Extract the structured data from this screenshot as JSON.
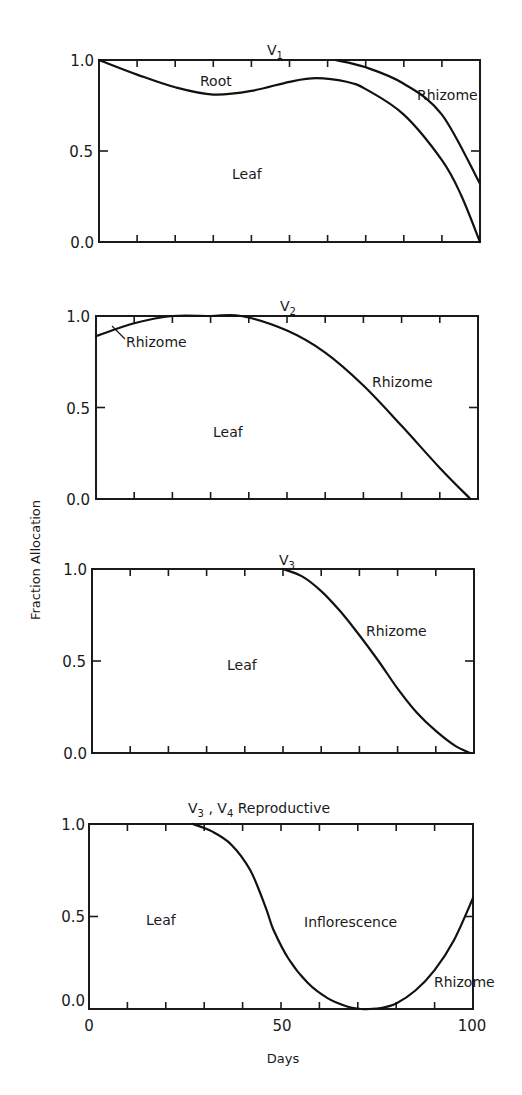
{
  "figure": {
    "ylabel": "Fraction  Allocation",
    "xlabel": "Days",
    "x_tick_labels": [
      "0",
      "50",
      "100"
    ],
    "y_tick_labels": [
      "1.0",
      "0.5",
      "0.0"
    ]
  },
  "panels": [
    {
      "title_main": "V",
      "title_sub": "1",
      "title_suffix": "",
      "labels": {
        "leaf": "Leaf",
        "root": "Root",
        "rhizome": "Rhizome"
      }
    },
    {
      "title_main": "V",
      "title_sub": "2",
      "title_suffix": "",
      "labels": {
        "leaf": "Leaf",
        "rhizome_early": "Rhizome",
        "rhizome": "Rhizome"
      }
    },
    {
      "title_main": "V",
      "title_sub": "3",
      "title_suffix": "",
      "labels": {
        "leaf": "Leaf",
        "rhizome": "Rhizome"
      }
    },
    {
      "title_main": "V",
      "title_sub": "3",
      "title_sep": " ,  V",
      "title_sub2": "4",
      "title_suffix": "  Reproductive",
      "labels": {
        "leaf": "Leaf",
        "inflorescence": "Inflorescence",
        "rhizome": "Rhizome"
      }
    }
  ],
  "chart_data": [
    {
      "type": "area",
      "title": "V1",
      "xlabel": "Days",
      "ylabel": "Fraction Allocation",
      "xlim": [
        0,
        100
      ],
      "ylim": [
        0,
        1
      ],
      "grid": false,
      "x_ticks": [
        0,
        10,
        20,
        30,
        40,
        50,
        60,
        70,
        80,
        90,
        100
      ],
      "y_ticks": [
        0.0,
        0.5,
        1.0
      ],
      "boundaries": [
        {
          "name": "Leaf / Root boundary",
          "x": [
            0,
            10,
            20,
            30,
            40,
            50,
            57,
            65,
            70,
            80,
            90,
            95,
            100
          ],
          "y": [
            1.0,
            0.92,
            0.85,
            0.81,
            0.83,
            0.88,
            0.9,
            0.88,
            0.84,
            0.7,
            0.45,
            0.26,
            0.0
          ]
        },
        {
          "name": "Root / Rhizome boundary",
          "x": [
            62,
            70,
            80,
            90,
            100
          ],
          "y": [
            1.0,
            0.96,
            0.87,
            0.7,
            0.32
          ]
        }
      ],
      "regions": [
        "Leaf",
        "Root",
        "Rhizome"
      ]
    },
    {
      "type": "area",
      "title": "V2",
      "xlabel": "Days",
      "ylabel": "Fraction Allocation",
      "xlim": [
        0,
        100
      ],
      "ylim": [
        0,
        1
      ],
      "grid": false,
      "x_ticks": [
        0,
        10,
        20,
        30,
        40,
        50,
        60,
        70,
        80,
        90,
        100
      ],
      "y_ticks": [
        0.0,
        0.5,
        1.0
      ],
      "boundaries": [
        {
          "name": "Leaf / Rhizome boundary",
          "x": [
            0,
            10,
            20,
            30,
            38,
            50,
            60,
            70,
            80,
            90,
            98
          ],
          "y": [
            0.89,
            0.96,
            1.0,
            1.0,
            1.0,
            0.92,
            0.8,
            0.62,
            0.4,
            0.17,
            0.0
          ]
        }
      ],
      "regions": [
        "Leaf",
        "Rhizome"
      ]
    },
    {
      "type": "area",
      "title": "V3",
      "xlabel": "Days",
      "ylabel": "Fraction Allocation",
      "xlim": [
        0,
        100
      ],
      "ylim": [
        0,
        1
      ],
      "grid": false,
      "x_ticks": [
        0,
        10,
        20,
        30,
        40,
        50,
        60,
        70,
        80,
        90,
        100
      ],
      "y_ticks": [
        0.0,
        0.5,
        1.0
      ],
      "boundaries": [
        {
          "name": "Leaf / Rhizome boundary",
          "x": [
            50,
            55,
            60,
            65,
            70,
            75,
            80,
            85,
            90,
            95,
            99
          ],
          "y": [
            1.0,
            0.96,
            0.88,
            0.77,
            0.64,
            0.5,
            0.35,
            0.22,
            0.12,
            0.04,
            0.0
          ]
        }
      ],
      "regions": [
        "Leaf",
        "Rhizome"
      ]
    },
    {
      "type": "area",
      "title": "V3 , V4 Reproductive",
      "xlabel": "Days",
      "ylabel": "Fraction Allocation",
      "xlim": [
        0,
        100
      ],
      "ylim": [
        0,
        1
      ],
      "grid": false,
      "x_ticks": [
        0,
        10,
        20,
        30,
        40,
        50,
        60,
        70,
        80,
        90,
        100
      ],
      "x_tick_labels": [
        "0",
        "50",
        "100"
      ],
      "y_ticks": [
        0.0,
        0.5,
        1.0
      ],
      "boundaries": [
        {
          "name": "Leaf / Inflorescence boundary",
          "x": [
            27,
            32,
            37,
            42,
            46,
            48,
            52,
            57,
            62,
            67,
            71,
            73,
            76,
            80,
            85,
            90,
            95,
            100
          ],
          "y": [
            1.0,
            0.96,
            0.89,
            0.75,
            0.55,
            0.43,
            0.27,
            0.14,
            0.06,
            0.015,
            0.0,
            0.0,
            0.005,
            0.03,
            0.1,
            0.21,
            0.37,
            0.6
          ]
        }
      ],
      "regions": [
        "Leaf",
        "Inflorescence",
        "Rhizome"
      ]
    }
  ],
  "layout": {
    "panels_px": [
      {
        "left": 99,
        "right": 480,
        "top": 60,
        "bottom": 242
      },
      {
        "left": 96,
        "right": 478,
        "top": 316,
        "bottom": 499
      },
      {
        "left": 92,
        "right": 474,
        "top": 569,
        "bottom": 753
      },
      {
        "left": 89,
        "right": 473,
        "top": 824,
        "bottom": 1009
      }
    ]
  }
}
